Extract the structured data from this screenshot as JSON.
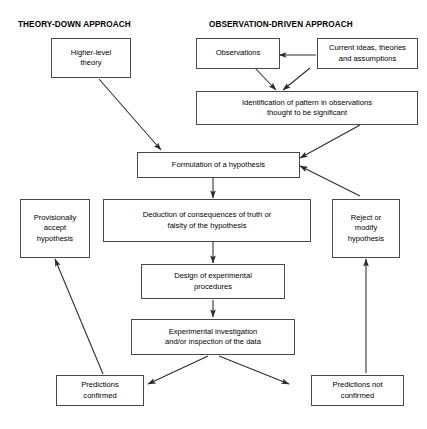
{
  "diagram": {
    "columns": [
      {
        "id": "theory-down",
        "label": "THEORY-DOWN APPROACH"
      },
      {
        "id": "observation-driven",
        "label": "OBSERVATION-DRIVEN APPROACH"
      }
    ],
    "nodes": [
      {
        "id": "higher-level-theory",
        "label": "Higher-level\ntheory"
      },
      {
        "id": "observations",
        "label": "Observations"
      },
      {
        "id": "current-ideas",
        "label": "Current ideas, theories\nand assumptions"
      },
      {
        "id": "identification-of-pattern",
        "label": "Identification of pattern in observations\nthought to be significant"
      },
      {
        "id": "formulation-of-hypothesis",
        "label": "Formulation of a hypothesis"
      },
      {
        "id": "provisionally-accept-hypothesis",
        "label": "Provisionally\naccept\nhypothesis"
      },
      {
        "id": "deduction-of-consequences",
        "label": "Deduction of consequences of truth or\nfalsity of the hypothesis"
      },
      {
        "id": "reject-or-modify-hypothesis",
        "label": "Reject or\nmodify\nhypothesis"
      },
      {
        "id": "design-of-experimental-procedures",
        "label": "Design of experimental\nprocedures"
      },
      {
        "id": "experimental-investigation",
        "label": "Experimental investigation\nand/or inspection of the data"
      },
      {
        "id": "predictions-confirmed",
        "label": "Predictions\nconfirmed"
      },
      {
        "id": "predictions-not-confirmed",
        "label": "Predictions not\nconfirmed"
      }
    ],
    "edges": [
      {
        "from": "current-ideas",
        "to": "observations",
        "style": "solid-arrow"
      },
      {
        "from": "observations",
        "to": "identification-of-pattern",
        "style": "solid-arrow"
      },
      {
        "from": "current-ideas",
        "to": "identification-of-pattern",
        "style": "solid-arrow"
      },
      {
        "from": "higher-level-theory",
        "to": "formulation-of-hypothesis",
        "style": "solid-arrow"
      },
      {
        "from": "identification-of-pattern",
        "to": "formulation-of-hypothesis",
        "style": "solid-arrow"
      },
      {
        "from": "reject-or-modify-hypothesis",
        "to": "formulation-of-hypothesis",
        "style": "solid-arrow"
      },
      {
        "from": "formulation-of-hypothesis",
        "to": "deduction-of-consequences",
        "style": "solid-arrow"
      },
      {
        "from": "deduction-of-consequences",
        "to": "design-of-experimental-procedures",
        "style": "solid-arrow"
      },
      {
        "from": "design-of-experimental-procedures",
        "to": "experimental-investigation",
        "style": "solid-arrow"
      },
      {
        "from": "experimental-investigation",
        "to": "predictions-confirmed",
        "style": "solid-arrow"
      },
      {
        "from": "experimental-investigation",
        "to": "predictions-not-confirmed",
        "style": "solid-arrow"
      },
      {
        "from": "predictions-confirmed",
        "to": "provisionally-accept-hypothesis",
        "style": "solid-arrow"
      },
      {
        "from": "predictions-not-confirmed",
        "to": "reject-or-modify-hypothesis",
        "style": "solid-arrow"
      }
    ],
    "colors": {
      "background": "#ffffff",
      "box_border": "#4a4a4a",
      "text": "#000000",
      "arrow": "#2b2b2b"
    }
  }
}
